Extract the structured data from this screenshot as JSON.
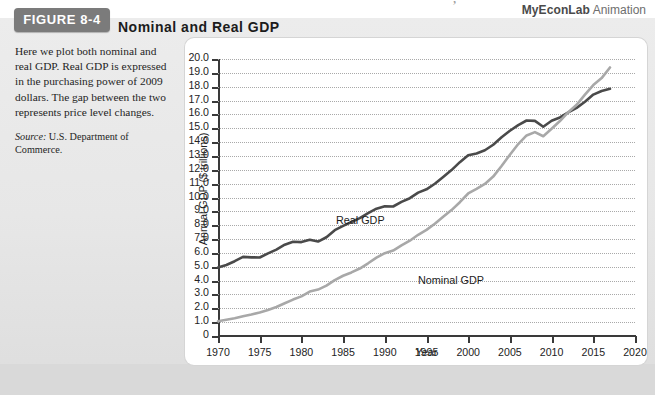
{
  "figure": {
    "tab_label": "FIGURE 8-4",
    "title": "Nominal and Real GDP",
    "artifact_glyph": "’"
  },
  "branding": {
    "product": "MyEconLab",
    "suffix": " Animation"
  },
  "caption": {
    "body": "Here we plot both nominal and real GDP. Real GDP is expressed in the purchasing power of 2009 dollars. The gap between the two represents price level changes.",
    "source_label": "Source:",
    "source_text": " U.S. Department of Commerce."
  },
  "chart_data": {
    "type": "line",
    "title": "Nominal and Real GDP",
    "xlabel": "Year",
    "ylabel": "Annual GDP ($ trillions)",
    "xlim": [
      1970,
      2020
    ],
    "ylim": [
      0,
      20
    ],
    "grid": true,
    "legend": "inline-labels",
    "xticks": [
      1970,
      1975,
      1980,
      1985,
      1990,
      1995,
      2000,
      2005,
      2010,
      2015,
      2020
    ],
    "xtick_labels": [
      "1970",
      "1975",
      "1980",
      "1985",
      "1990",
      "1995",
      "2000",
      "2005",
      "2010",
      "2015",
      "2020"
    ],
    "yticks": [
      0,
      1,
      2,
      3,
      4,
      5,
      6,
      7,
      8,
      9,
      10,
      11,
      12,
      13,
      14,
      15,
      16,
      17,
      18,
      19,
      20
    ],
    "ytick_labels": [
      "0",
      "1.0",
      "2.0",
      "3.0",
      "4.0",
      "5.0",
      "6.0",
      "7.0",
      "8.0",
      "9.0",
      "10.0",
      "11.0",
      "12.0",
      "13.0",
      "14.0",
      "15.0",
      "16.0",
      "17.0",
      "18.0",
      "19.0",
      "20.0"
    ],
    "x": [
      1970,
      1971,
      1972,
      1973,
      1974,
      1975,
      1976,
      1977,
      1978,
      1979,
      1980,
      1981,
      1982,
      1983,
      1984,
      1985,
      1986,
      1987,
      1988,
      1989,
      1990,
      1991,
      1992,
      1993,
      1994,
      1995,
      1996,
      1997,
      1998,
      1999,
      2000,
      2001,
      2002,
      2003,
      2004,
      2005,
      2006,
      2007,
      2008,
      2009,
      2010,
      2011,
      2012,
      2013,
      2014,
      2015,
      2016,
      2017
    ],
    "series": [
      {
        "name": "Real GDP",
        "label": "Real GDP",
        "color": "#4a4a4a",
        "units": "trillions of 2009 dollars",
        "values": [
          4.95,
          5.13,
          5.4,
          5.71,
          5.68,
          5.67,
          5.97,
          6.24,
          6.59,
          6.8,
          6.78,
          6.95,
          6.82,
          7.13,
          7.64,
          7.95,
          8.23,
          8.51,
          8.87,
          9.19,
          9.37,
          9.35,
          9.68,
          9.95,
          10.35,
          10.59,
          10.99,
          11.48,
          11.98,
          12.55,
          13.05,
          13.18,
          13.41,
          13.81,
          14.35,
          14.82,
          15.23,
          15.56,
          15.53,
          15.11,
          15.54,
          15.78,
          16.14,
          16.47,
          16.91,
          17.43,
          17.69,
          17.85
        ]
      },
      {
        "name": "Nominal GDP",
        "label": "Nominal GDP",
        "color": "#a8a8a8",
        "units": "trillions of current dollars",
        "values": [
          1.07,
          1.17,
          1.28,
          1.43,
          1.55,
          1.69,
          1.88,
          2.09,
          2.36,
          2.63,
          2.86,
          3.21,
          3.35,
          3.64,
          4.04,
          4.35,
          4.59,
          4.87,
          5.25,
          5.66,
          5.98,
          6.17,
          6.54,
          6.88,
          7.31,
          7.66,
          8.1,
          8.61,
          9.09,
          9.66,
          10.29,
          10.62,
          10.98,
          11.51,
          12.27,
          13.09,
          13.86,
          14.48,
          14.72,
          14.42,
          14.96,
          15.52,
          16.16,
          16.69,
          17.43,
          18.12,
          18.62,
          19.39
        ]
      }
    ]
  }
}
